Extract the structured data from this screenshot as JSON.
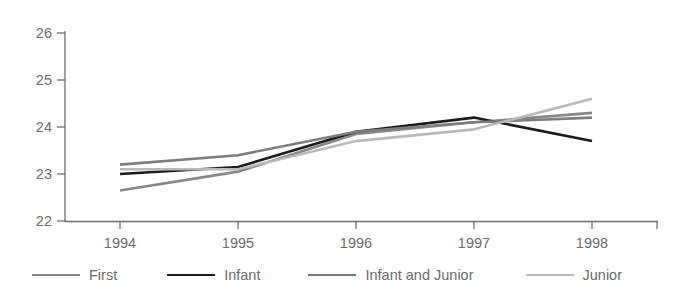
{
  "chart_data": {
    "type": "line",
    "title": "",
    "xlabel": "",
    "ylabel": "",
    "categories": [
      "1994",
      "1995",
      "1996",
      "1997",
      "1998"
    ],
    "x_tick_labels": [
      "1994",
      "1995",
      "1996",
      "1997",
      "1998"
    ],
    "y_tick_labels": [
      "22",
      "23",
      "24",
      "25",
      "26"
    ],
    "ylim": [
      22,
      26
    ],
    "y_ticks": [
      22,
      23,
      24,
      25,
      26
    ],
    "grid": false,
    "legend_position": "bottom",
    "series": [
      {
        "name": "First",
        "color": "#878787",
        "width": 2.6,
        "values": [
          22.65,
          23.05,
          23.85,
          24.1,
          24.3
        ]
      },
      {
        "name": "Infant",
        "color": "#1a1a1a",
        "width": 2.6,
        "values": [
          23.0,
          23.15,
          23.9,
          24.2,
          23.7
        ]
      },
      {
        "name": "Infant and Junior",
        "color": "#7d7d7d",
        "width": 2.6,
        "values": [
          23.2,
          23.4,
          23.9,
          24.1,
          24.2
        ]
      },
      {
        "name": "Junior",
        "color": "#b9b9b9",
        "width": 2.6,
        "values": [
          23.1,
          23.1,
          23.7,
          23.95,
          24.6
        ]
      }
    ]
  },
  "legend": {
    "items": [
      {
        "label": "First",
        "color": "#878787"
      },
      {
        "label": "Infant",
        "color": "#1a1a1a"
      },
      {
        "label": "Infant and Junior",
        "color": "#7d7d7d"
      },
      {
        "label": "Junior",
        "color": "#b9b9b9"
      }
    ]
  },
  "axes": {
    "y_labels": [
      "26",
      "25",
      "24",
      "23",
      "22"
    ],
    "x_labels": [
      "1994",
      "1995",
      "1996",
      "1997",
      "1998"
    ]
  }
}
